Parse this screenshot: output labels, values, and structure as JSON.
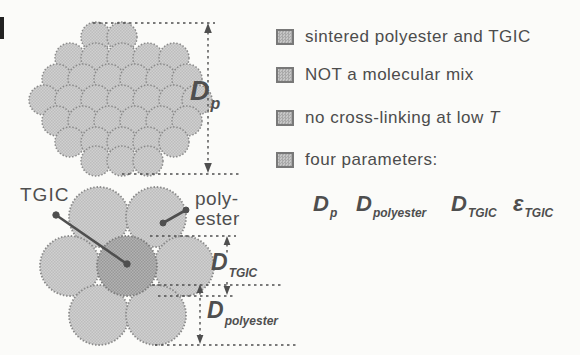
{
  "colors": {
    "background": "#fbfbf9",
    "particle_light": "#cfcfcf",
    "particle_dark": "#b2b2b2",
    "line": "#4f4f4f",
    "text": "#4c4c4c"
  },
  "left_diagram": {
    "dp_label": {
      "main": "D",
      "sub": "p"
    },
    "tgic_callout": "TGIC",
    "polyester_callout": "poly-\nester",
    "d_tgic_label": {
      "main": "D",
      "sub": "TGIC"
    },
    "d_polyester_label": {
      "main": "D",
      "sub": "polyester"
    }
  },
  "bullets": [
    {
      "text": "sintered polyester and TGIC",
      "italic_suffix": ""
    },
    {
      "text": "NOT a molecular mix",
      "italic_suffix": ""
    },
    {
      "text": "no cross-linking at low ",
      "italic_suffix": "T"
    },
    {
      "text": "four parameters:",
      "italic_suffix": ""
    }
  ],
  "parameters": [
    {
      "main": "D",
      "sub": "p"
    },
    {
      "main": "D",
      "sub": "polyester"
    },
    {
      "main": "D",
      "sub": "TGIC"
    },
    {
      "main": "ε",
      "sub": "TGIC"
    }
  ]
}
